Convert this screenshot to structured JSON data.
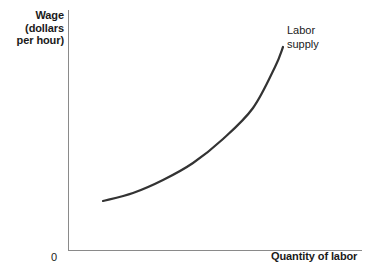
{
  "chart_data": {
    "type": "line",
    "title": "",
    "subtitle": "",
    "xlabel": "Quantity of labor",
    "ylabel": "Wage (dollars per hour)",
    "ylabel_lines": [
      "Wage",
      "(dollars",
      "per hour)"
    ],
    "origin_label": "0",
    "grid": false,
    "legend_position": "inline-annotation",
    "xlim": [
      0,
      1
    ],
    "ylim": [
      0,
      1
    ],
    "xticks": [],
    "yticks": [],
    "xticklabels": [],
    "yticklabels": [],
    "annotations": [
      {
        "text": "Labor supply",
        "lines": [
          "Labor",
          "supply"
        ],
        "attached_to": "labor-supply-curve",
        "position": "upper-right of curve endpoint"
      }
    ],
    "series": [
      {
        "name": "Labor supply",
        "style": "solid",
        "color": "#333333",
        "linewidth": 2.2,
        "shape": "upward-sloping convex",
        "description": "Wage rises with quantity of labor at an increasing rate",
        "x": [
          0.12,
          0.22,
          0.32,
          0.42,
          0.52,
          0.62,
          0.72,
          0.78
        ],
        "y": [
          0.2,
          0.24,
          0.3,
          0.37,
          0.47,
          0.6,
          0.77,
          0.845
        ],
        "points_px": [
          [
            103,
            201
          ],
          [
            133,
            193
          ],
          [
            163,
            180
          ],
          [
            193,
            163
          ],
          [
            223,
            139
          ],
          [
            253,
            108
          ],
          [
            275,
            67
          ],
          [
            283,
            47
          ]
        ]
      }
    ],
    "axes": {
      "y_axis_px": {
        "x": 68,
        "y_top": 10,
        "y_bottom": 250
      },
      "x_axis_px": {
        "y": 250,
        "x_left": 68,
        "x_right": 362
      },
      "color": "#8a8a8a",
      "linewidth": 1
    }
  },
  "colors": {
    "background": "#ffffff",
    "axis": "#8a8a8a",
    "curve": "#333333",
    "text": "#1a1a1a"
  }
}
